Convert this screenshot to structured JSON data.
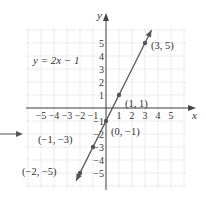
{
  "chart_data": {
    "type": "line",
    "title": "",
    "equation": "y = 2x − 1",
    "xlabel": "x",
    "ylabel": "y",
    "xlim": [
      -5,
      5
    ],
    "ylim": [
      -5,
      5
    ],
    "grid": true,
    "x_ticks": [
      "−5",
      "−4",
      "−3",
      "−2",
      "−1",
      "1",
      "2",
      "3",
      "4",
      "5"
    ],
    "y_ticks": [
      "5",
      "4",
      "3",
      "2",
      "1",
      "−1",
      "−2",
      "−3",
      "−4",
      "−5"
    ],
    "series": [
      {
        "name": "y = 2x − 1",
        "slope": 2,
        "intercept": -1,
        "points": [
          {
            "x": -2,
            "y": -5,
            "label": "(−2, −5)"
          },
          {
            "x": -1,
            "y": -3,
            "label": "(−1, −3)"
          },
          {
            "x": 0,
            "y": -1,
            "label": "(0, −1)"
          },
          {
            "x": 1,
            "y": 1,
            "label": "(1, 1)"
          },
          {
            "x": 3,
            "y": 5,
            "label": "(3, 5)"
          }
        ]
      }
    ],
    "annotations": [
      "left-pointing arrow indicating figure"
    ],
    "colors": {
      "line": "#555555",
      "grid": "#d8d8d8",
      "axis": "#444444",
      "point": "#555555"
    }
  }
}
